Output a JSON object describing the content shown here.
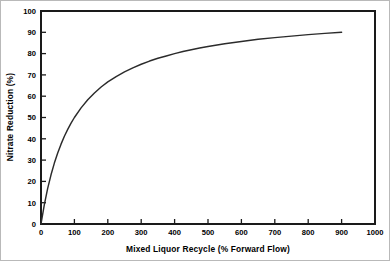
{
  "chart_data": {
    "type": "line",
    "title": "",
    "xlabel": "Mixed Liquor Recycle (% Forward Flow)",
    "ylabel": "Nitrate Reduction (%)",
    "xlim": [
      0,
      1000
    ],
    "ylim": [
      0,
      100
    ],
    "xticks": [
      0,
      100,
      200,
      300,
      400,
      500,
      600,
      700,
      800,
      900,
      1000
    ],
    "yticks": [
      0,
      10,
      20,
      30,
      40,
      50,
      60,
      70,
      80,
      90,
      100
    ],
    "xtick_labels": [
      "0",
      "100",
      "200",
      "300",
      "400",
      "500",
      "600",
      "700",
      "800",
      "900",
      "1000"
    ],
    "ytick_labels": [
      "0",
      "10",
      "20",
      "30",
      "40",
      "50",
      "60",
      "70",
      "80",
      "90",
      "100"
    ],
    "grid": false,
    "legend": false,
    "legend_position": "none",
    "frame": "box",
    "tick_direction": "in",
    "line_color": "#2b2b2b",
    "background_color": "#ffffff",
    "series": [
      {
        "name": "Nitrate Reduction",
        "x": [
          0,
          10,
          20,
          30,
          40,
          50,
          60,
          70,
          80,
          90,
          100,
          120,
          140,
          160,
          180,
          200,
          225,
          250,
          275,
          300,
          325,
          350,
          375,
          400,
          425,
          450,
          475,
          500,
          550,
          600,
          650,
          700,
          750,
          800,
          850,
          900
        ],
        "values": [
          0,
          9.1,
          16.7,
          23.1,
          28.6,
          33.3,
          37.5,
          41.2,
          44.4,
          47.4,
          50.0,
          54.5,
          58.3,
          61.5,
          64.3,
          66.7,
          69.2,
          71.4,
          73.3,
          75.0,
          76.5,
          77.8,
          78.9,
          80.0,
          81.0,
          81.8,
          82.6,
          83.3,
          84.6,
          85.7,
          86.7,
          87.5,
          88.2,
          88.9,
          89.5,
          90.0
        ]
      }
    ]
  },
  "figure": {
    "x_axis_title": "Mixed Liquor Recycle (% Forward Flow)",
    "y_axis_title": "Nitrate Reduction (%)"
  }
}
